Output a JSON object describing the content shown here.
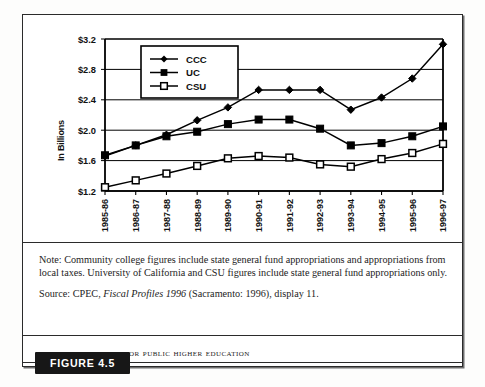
{
  "figure": {
    "badge_label": "FIGURE 4.5",
    "caption_title": "California Funding for Public Higher Education"
  },
  "note": {
    "note_text": "Note: Community college figures include state general fund appropriations and appropriations from local taxes. University of California and CSU figures include state general fund appropriations only.",
    "source_prefix": "Source: CPEC, ",
    "source_italic": "Fiscal Profiles 1996",
    "source_suffix": " (Sacramento: 1996), display 11."
  },
  "chart_data": {
    "type": "line",
    "title": "California Funding for Public Higher Education",
    "xlabel": "",
    "ylabel": "In Billions",
    "ylim": [
      1.2,
      3.2
    ],
    "ytick_step": 0.4,
    "ytick_labels": [
      "$1.2",
      "$1.6",
      "$2.0",
      "$2.4",
      "$2.8",
      "$3.2"
    ],
    "ytick_values": [
      1.2,
      1.6,
      2.0,
      2.4,
      2.8,
      3.2
    ],
    "grid": true,
    "legend_position": "top-left-inside",
    "categories": [
      "1985-86",
      "1986-87",
      "1987-88",
      "1988-89",
      "1989-90",
      "1990-91",
      "1991-92",
      "1992-93",
      "1993-94",
      "1994-95",
      "1995-96",
      "1996-97"
    ],
    "series": [
      {
        "name": "CCC",
        "marker": "filled-diamond",
        "values": [
          1.66,
          1.8,
          1.94,
          2.13,
          2.3,
          2.53,
          2.53,
          2.53,
          2.27,
          2.43,
          2.68,
          3.13
        ]
      },
      {
        "name": "UC",
        "marker": "filled-square",
        "values": [
          1.67,
          1.8,
          1.92,
          1.98,
          2.08,
          2.14,
          2.14,
          2.02,
          1.8,
          1.83,
          1.92,
          2.05
        ]
      },
      {
        "name": "CSU",
        "marker": "open-square",
        "values": [
          1.25,
          1.34,
          1.43,
          1.53,
          1.63,
          1.66,
          1.64,
          1.55,
          1.52,
          1.62,
          1.7,
          1.82
        ]
      }
    ]
  }
}
